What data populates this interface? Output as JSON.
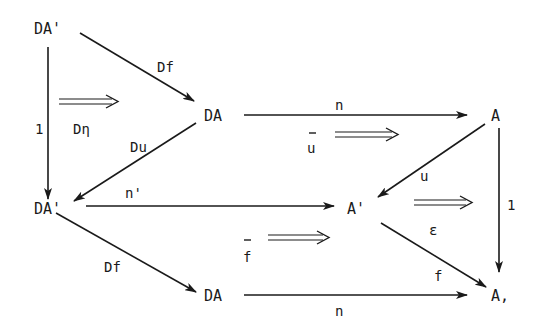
{
  "diagram": {
    "type": "commutative-diagram",
    "nodes": {
      "da_prime_top": "DA'",
      "da_mid": "DA",
      "a_top_right": "A",
      "da_prime_mid": "DA'",
      "a_prime": "A'",
      "da_bottom": "DA",
      "a_bottom_right": "A,"
    },
    "arrows": {
      "df_top": "Df",
      "identity_left": "1",
      "du": "Du",
      "n_top": "n",
      "u": "u",
      "n_prime": "n'",
      "identity_right": "1",
      "df_bottom": "Df",
      "f": "f",
      "n_bottom": "n"
    },
    "two_cells": {
      "d_eta": "Dη",
      "u_bar": "u",
      "epsilon": "ε",
      "f_bar": "f"
    },
    "edges": [
      {
        "from": "DA'",
        "to": "DA",
        "label": "Df"
      },
      {
        "from": "DA'",
        "to": "DA'",
        "label": "1"
      },
      {
        "from": "DA",
        "to": "DA'",
        "label": "Du"
      },
      {
        "from": "DA",
        "to": "A",
        "label": "n"
      },
      {
        "from": "A",
        "to": "A'",
        "label": "u"
      },
      {
        "from": "DA'",
        "to": "A'",
        "label": "n'"
      },
      {
        "from": "A",
        "to": "A,",
        "label": "1"
      },
      {
        "from": "DA'",
        "to": "DA",
        "label": "Df"
      },
      {
        "from": "A'",
        "to": "A,",
        "label": "f"
      },
      {
        "from": "DA",
        "to": "A,",
        "label": "n"
      }
    ]
  }
}
